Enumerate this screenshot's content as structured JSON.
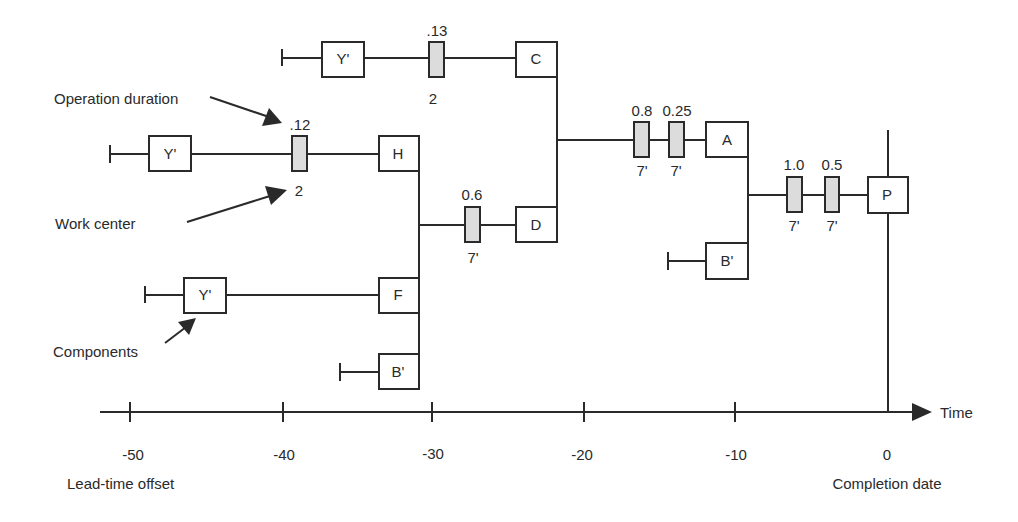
{
  "diagram": {
    "annotations": {
      "operation_duration": "Operation duration",
      "work_center": "Work center",
      "components": "Components",
      "lead_time_offset": "Lead-time offset",
      "completion_date": "Completion date"
    },
    "axis": {
      "label": "Time",
      "ticks": [
        "-50",
        "-40",
        "-30",
        "-20",
        "-10",
        "0"
      ]
    },
    "nodes": {
      "y_top": "Y'",
      "c": "C",
      "y_mid": "Y'",
      "h": "H",
      "y_low": "Y'",
      "f": "F",
      "b_low": "B'",
      "d": "D",
      "a": "A",
      "b_right": "B'",
      "p": "P"
    },
    "operations": [
      {
        "id": "op_c",
        "duration": ".13",
        "work_center": "2"
      },
      {
        "id": "op_h",
        "duration": ".12",
        "work_center": "2"
      },
      {
        "id": "op_d",
        "duration": "0.6",
        "work_center": "7'"
      },
      {
        "id": "op_a1",
        "duration": "0.8",
        "work_center": "7'"
      },
      {
        "id": "op_a2",
        "duration": "0.25",
        "work_center": "7'"
      },
      {
        "id": "op_p1",
        "duration": "1.0",
        "work_center": "7'"
      },
      {
        "id": "op_p2",
        "duration": "0.5",
        "work_center": "7'"
      }
    ],
    "colors": {
      "stroke": "#2a2a2a",
      "operation_fill": "#dcdcdc",
      "background": "#ffffff"
    }
  }
}
